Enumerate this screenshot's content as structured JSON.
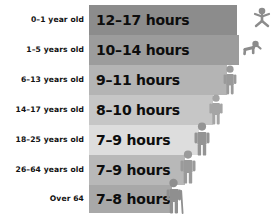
{
  "chart_data": {
    "type": "bar",
    "title": "",
    "xlabel": "",
    "ylabel": "",
    "categories": [
      "0–1 year old",
      "1–5 years old",
      "6–13 years old",
      "14–17 years old",
      "18–25 years old",
      "26–64 years old",
      "Over 64"
    ],
    "value_labels": [
      "12–17 hours",
      "10–14 hours",
      "9–11 hours",
      "8–10 hours",
      "7–9 hours",
      "7–9 hours",
      "7–8 hours"
    ],
    "low_values": [
      12,
      10,
      9,
      8,
      7,
      7,
      7
    ],
    "high_values": [
      17,
      14,
      11,
      10,
      9,
      9,
      8
    ],
    "units": "hours",
    "grid": false,
    "legend": "none"
  },
  "rows": [
    {
      "age": "0–1 year old",
      "hours": "12–17 hours",
      "bar_color": "#8c8c8c",
      "bar_width": 148,
      "top": 5,
      "height": 30,
      "icon": "infant-icon",
      "icon_color": "#8c8c8c",
      "icon_x": 252,
      "icon_y": 7
    },
    {
      "age": "1–5 years old",
      "hours": "10–14 hours",
      "bar_color": "#9c9c9c",
      "bar_width": 150,
      "top": 35,
      "height": 30,
      "icon": "toddler-crawling-icon",
      "icon_color": "#8c8c8c",
      "icon_x": 240,
      "icon_y": 40
    },
    {
      "age": "6–13 years old",
      "hours": "9–11 hours",
      "bar_color": "#b4b4b4",
      "bar_width": 138,
      "top": 65,
      "height": 30,
      "icon": "child-standing-icon",
      "icon_color": "#9a9a9a",
      "icon_x": 222,
      "icon_y": 65
    },
    {
      "age": "14–17 years old",
      "hours": "8–10 hours",
      "bar_color": "#c6c6c6",
      "bar_width": 124,
      "top": 95,
      "height": 30,
      "icon": "teen-standing-icon",
      "icon_color": "#a5a5a5",
      "icon_x": 208,
      "icon_y": 94
    },
    {
      "age": "18–25 years old",
      "hours": "7–9 hours",
      "bar_color": "#dddddd",
      "bar_width": 110,
      "top": 125,
      "height": 30,
      "icon": "young-adult-icon",
      "icon_color": "#949494",
      "icon_x": 193,
      "icon_y": 122
    },
    {
      "age": "26–64 years old",
      "hours": "7–9 hours",
      "bar_color": "#b8b8b8",
      "bar_width": 96,
      "top": 155,
      "height": 30,
      "icon": "adult-icon",
      "icon_color": "#9a9a9a",
      "icon_x": 179,
      "icon_y": 150
    },
    {
      "age": "Over 64",
      "hours": "7–8 hours",
      "bar_color": "#a8a8a8",
      "bar_width": 83,
      "top": 185,
      "height": 28,
      "icon": "senior-with-cane-icon",
      "icon_color": "#8f8f8f",
      "icon_x": 165,
      "icon_y": 178
    }
  ],
  "colors": {
    "background": "#ffffff",
    "label_text": "#111111",
    "bar_text": "#0d0d0d"
  }
}
